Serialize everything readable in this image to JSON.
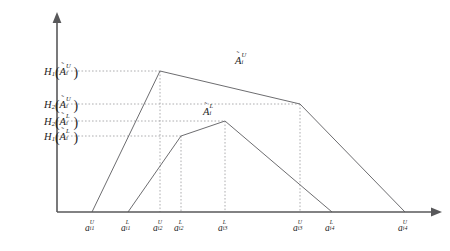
{
  "figure": {
    "type": "membership-function-diagram",
    "background_color": "#ffffff",
    "curve_color": "#6d6d70",
    "axis_color": "#58585a",
    "guide_color": "#9a9a9d",
    "text_color": "#1c1c1c"
  },
  "axes": {
    "origin_x": 57,
    "origin_y": 212,
    "x_axis_end": 441,
    "y_axis_top": 14
  },
  "y_labels": [
    {
      "id": "h1-upper",
      "fn": "H",
      "fn_sub": "1",
      "arg_letter": "A",
      "arg_sub": "i",
      "arg_sup": "U",
      "text": "H1(Ã_i^U)",
      "y": 71,
      "label_right": 78
    },
    {
      "id": "h2-upper",
      "fn": "H",
      "fn_sub": "2",
      "arg_letter": "A",
      "arg_sub": "i",
      "arg_sup": "U",
      "text": "H2(Ã_i^U)",
      "y": 104,
      "label_right": 78
    },
    {
      "id": "h2-lower",
      "fn": "H",
      "fn_sub": "2",
      "arg_letter": "A",
      "arg_sub": "i",
      "arg_sup": "L",
      "text": "H2(Ã_i^L)",
      "y": 121,
      "label_right": 78
    },
    {
      "id": "h1-lower",
      "fn": "H",
      "fn_sub": "1",
      "arg_letter": "A",
      "arg_sub": "i",
      "arg_sup": "L",
      "text": "H1(Ã_i^L)",
      "y": 136,
      "label_right": 78
    }
  ],
  "x_labels": [
    {
      "id": "ai1u",
      "letter": "a",
      "sub": "i1",
      "sup": "U",
      "text": "a_i1^U",
      "x": 92
    },
    {
      "id": "ai1l",
      "letter": "a",
      "sub": "i1",
      "sup": "L",
      "text": "a_i1^L",
      "x": 128
    },
    {
      "id": "ai2u",
      "letter": "a",
      "sub": "i2",
      "sup": "U",
      "text": "a_i2^U",
      "x": 160
    },
    {
      "id": "ai2l",
      "letter": "a",
      "sub": "i2",
      "sup": "L",
      "text": "a_i2^L",
      "x": 181
    },
    {
      "id": "ai3l",
      "letter": "a",
      "sub": "i3",
      "sup": "L",
      "text": "a_i3^L",
      "x": 225
    },
    {
      "id": "ai3u",
      "letter": "a",
      "sub": "i3",
      "sup": "U",
      "text": "a_i3^U",
      "x": 300
    },
    {
      "id": "ai4l",
      "letter": "a",
      "sub": "i4",
      "sup": "L",
      "text": "a_i4^L",
      "x": 332
    },
    {
      "id": "ai4u",
      "letter": "a",
      "sub": "i4",
      "sup": "U",
      "text": "a_i4^U",
      "x": 405
    }
  ],
  "curve_labels": [
    {
      "id": "upper-mf-label",
      "letter": "A",
      "sub": "i",
      "sup": "U",
      "text": "Ã_i^U",
      "x": 238,
      "y": 58
    },
    {
      "id": "lower-mf-label",
      "letter": "A",
      "sub": "i",
      "sup": "L",
      "text": "Ã_i^L",
      "x": 205,
      "y": 107
    }
  ],
  "chart_data": {
    "type": "line",
    "title": "",
    "xlabel": "",
    "ylabel": "",
    "grid": true,
    "legend_position": "inline",
    "x_tick_labels": [
      "a_i1^U",
      "a_i1^L",
      "a_i2^U",
      "a_i2^L",
      "a_i3^L",
      "a_i3^U",
      "a_i4^L",
      "a_i4^U"
    ],
    "x_tick_pixels": [
      92,
      128,
      160,
      181,
      225,
      300,
      332,
      405
    ],
    "y_tick_labels": [
      "H1(Ã_i^U)",
      "H2(Ã_i^U)",
      "H2(Ã_i^L)",
      "H1(Ã_i^L)"
    ],
    "y_tick_pixels": [
      71,
      104,
      121,
      136
    ],
    "series": [
      {
        "name": "Ã_i^U",
        "points_px": [
          [
            92,
            212
          ],
          [
            160,
            71
          ],
          [
            300,
            104
          ],
          [
            405,
            212
          ]
        ]
      },
      {
        "name": "Ã_i^L",
        "points_px": [
          [
            128,
            212
          ],
          [
            181,
            136
          ],
          [
            225,
            121
          ],
          [
            332,
            212
          ]
        ]
      }
    ],
    "horizontal_guides_px": [
      {
        "y": 71,
        "x_from": 57,
        "x_to": 160
      },
      {
        "y": 104,
        "x_from": 57,
        "x_to": 300
      },
      {
        "y": 121,
        "x_from": 57,
        "x_to": 225
      },
      {
        "y": 136,
        "x_from": 57,
        "x_to": 181
      }
    ],
    "vertical_guides_px": [
      {
        "x": 160,
        "y_from": 71,
        "y_to": 212
      },
      {
        "x": 181,
        "y_from": 136,
        "y_to": 212
      },
      {
        "x": 225,
        "y_from": 121,
        "y_to": 212
      },
      {
        "x": 300,
        "y_from": 104,
        "y_to": 212
      }
    ]
  }
}
